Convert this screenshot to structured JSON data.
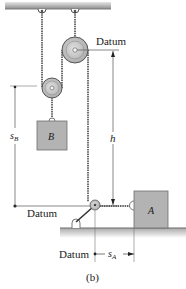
{
  "figure": {
    "caption": "(b)",
    "labels": {
      "datum_top": "Datum",
      "datum_left": "Datum",
      "datum_bottom": "Datum",
      "block_a": "A",
      "block_b": "B",
      "dim_h": "h",
      "dim_sb_main": "s",
      "dim_sb_sub": "B",
      "dim_sa_main": "s",
      "dim_sa_sub": "A"
    },
    "colors": {
      "block_fill": "#b3b3b3",
      "block_stroke": "#6e6e6e",
      "pulley_fill": "#c8c8c8",
      "ceiling": "#9a9a9a",
      "ground_shadow": "#c9c9c9",
      "cable": "#333333",
      "dim_line": "#555555"
    }
  }
}
